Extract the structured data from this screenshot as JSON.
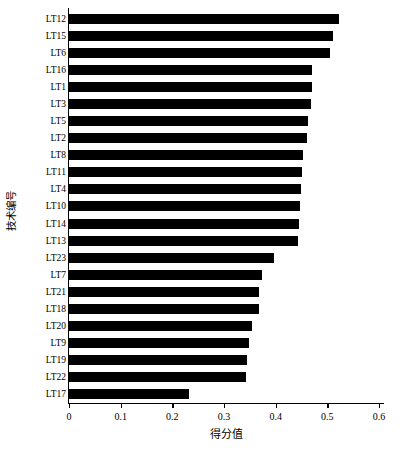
{
  "chart_data": {
    "type": "bar",
    "orientation": "horizontal",
    "title": "",
    "xlabel": "得分值",
    "ylabel": "技术编号",
    "xlim": [
      0,
      0.6
    ],
    "xticks": [
      "0",
      "0.1",
      "0.2",
      "0.3",
      "0.4",
      "0.5",
      "0.6"
    ],
    "xtick_values": [
      0,
      0.1,
      0.2,
      0.3,
      0.4,
      0.5,
      0.6
    ],
    "grid": false,
    "legend": null,
    "bar_color": "#000000",
    "background_color": "#ffffff",
    "categories": [
      "LT12",
      "LT15",
      "LT6",
      "LT16",
      "LT1",
      "LT3",
      "LT5",
      "LT2",
      "LT8",
      "LT11",
      "LT4",
      "LT10",
      "LT14",
      "LT13",
      "LT23",
      "LT7",
      "LT21",
      "LT18",
      "LT20",
      "LT9",
      "LT19",
      "LT22",
      "LT17"
    ],
    "values": [
      0.523,
      0.51,
      0.506,
      0.471,
      0.47,
      0.469,
      0.462,
      0.461,
      0.452,
      0.45,
      0.449,
      0.447,
      0.446,
      0.444,
      0.397,
      0.374,
      0.368,
      0.367,
      0.354,
      0.348,
      0.345,
      0.342,
      0.232
    ]
  }
}
